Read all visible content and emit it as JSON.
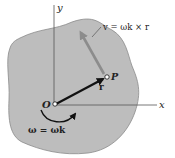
{
  "diagram": {
    "type": "rigid-body-rotation",
    "colors": {
      "body_fill": "#bdbdbd",
      "body_stroke": "#8a8a8a",
      "axis": "#555555",
      "r_vector": "#111111",
      "v_vector": "#8c8c8c",
      "text": "#222222"
    },
    "axes": {
      "x_label": "x",
      "y_label": "y"
    },
    "points": {
      "origin_label": "O",
      "point_label": "P"
    },
    "vectors": {
      "r_label": "r",
      "v_label": "v = ωk × r"
    },
    "rotation": {
      "omega_label": "ω = ωk"
    }
  }
}
